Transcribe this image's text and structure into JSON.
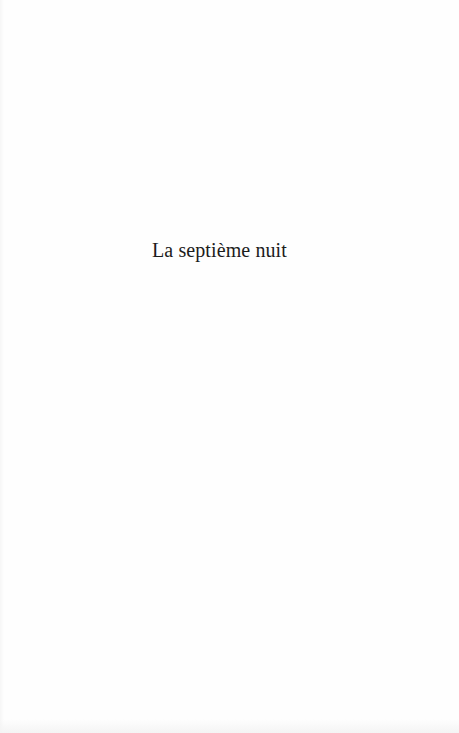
{
  "page": {
    "type": "half-title page",
    "title": "La septième nuit",
    "colors": {
      "background": "#fefefe",
      "text": "#1c1c1c"
    }
  }
}
